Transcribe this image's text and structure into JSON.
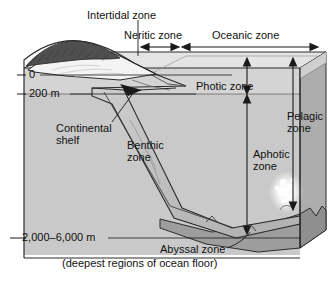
{
  "diagram": {
    "type": "labeled-cross-section",
    "colors": {
      "water": "#c9c9c9",
      "photic_band": "#d8d8d8",
      "top_face": "#e2e2e2",
      "side_face": "#a6a6a6",
      "floor_face": "#9a9a9a",
      "slope": "#bdbdbd",
      "land_dark": "#555555",
      "beach": "#f2f2f2",
      "line": "#1a1a1a",
      "text": "#111111",
      "vent_glow": "#ffffff"
    },
    "top_labels": [
      {
        "name": "intertidal",
        "text": "Intertidal zone"
      },
      {
        "name": "neritic",
        "text": "Neritic zone"
      },
      {
        "name": "oceanic",
        "text": "Oceanic zone"
      }
    ],
    "depth_axis": {
      "name": "depth-scale",
      "ticks": [
        {
          "value": "0",
          "label": "0"
        },
        {
          "value": "200",
          "label": "200 m"
        },
        {
          "value": "2000-6000",
          "label": "2,000–6,000 m"
        }
      ]
    },
    "interior_labels": [
      {
        "name": "continental-shelf",
        "line1": "Continental",
        "line2": "shelf"
      },
      {
        "name": "benthic-zone",
        "line1": "Benthic",
        "line2": "zone"
      },
      {
        "name": "photic-zone",
        "line1": "Photic zone",
        "line2": ""
      },
      {
        "name": "pelagic-zone",
        "line1": "Pelagic",
        "line2": "zone"
      },
      {
        "name": "aphotic-zone",
        "line1": "Aphotic",
        "line2": "zone"
      }
    ],
    "bottom_labels": {
      "abyssal_zone": "Abyssal zone",
      "abyssal_caption": "(deepest regions of ocean floor)"
    }
  }
}
